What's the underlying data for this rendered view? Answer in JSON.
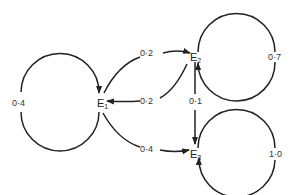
{
  "diagram": {
    "type": "state-transition",
    "nodes": [
      {
        "id": "E1",
        "base": "E",
        "sub": "1"
      },
      {
        "id": "E2",
        "base": "E",
        "sub": "2"
      },
      {
        "id": "E3",
        "base": "E",
        "sub": "3"
      }
    ],
    "edges": [
      {
        "from": "E1",
        "to": "E1",
        "label": "0·4"
      },
      {
        "from": "E1",
        "to": "E2",
        "label": "0·2"
      },
      {
        "from": "E2",
        "to": "E1",
        "label": "0·2"
      },
      {
        "from": "E1",
        "to": "E3",
        "label": "0·4"
      },
      {
        "from": "E2",
        "to": "E3",
        "label": "0·1"
      },
      {
        "from": "E2",
        "to": "E2",
        "label": "0·7"
      },
      {
        "from": "E3",
        "to": "E3",
        "label": "1·0"
      }
    ]
  }
}
